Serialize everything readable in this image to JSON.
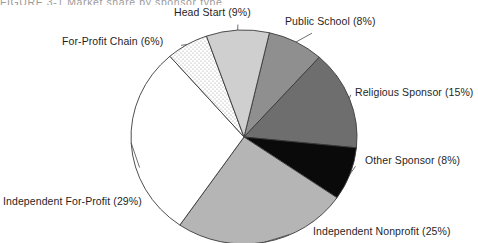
{
  "figure": {
    "title_fragment": "FIGURE 3-1    Market share by sponsor type",
    "width": 478,
    "height": 243
  },
  "chart_data": {
    "type": "pie",
    "title": "",
    "xlabel": "",
    "ylabel": "",
    "legend_position": "none",
    "grid": false,
    "label_format": "{name} ({value}%)",
    "units": "percent",
    "total": 100,
    "center": {
      "x": 244,
      "y": 137
    },
    "radius": {
      "rx": 113,
      "ry": 107
    },
    "start_angle_deg": -77,
    "direction": "clockwise",
    "categories": [
      "Public School",
      "Religious Sponsor",
      "Other Sponsor",
      "Independent Nonprofit",
      "Independent For-Profit",
      "For-Profit Chain",
      "Head Start"
    ],
    "values": [
      8,
      15,
      8,
      25,
      29,
      6,
      9
    ],
    "slices": [
      {
        "name": "Public School",
        "value": 8,
        "label": "Public School (8%)",
        "fill": "#8f8f8f",
        "pattern": "solid",
        "stroke": "#3a3a3a"
      },
      {
        "name": "Religious Sponsor",
        "value": 15,
        "label": "Religious Sponsor (15%)",
        "fill": "#6e6e6e",
        "pattern": "solid",
        "stroke": "#3a3a3a"
      },
      {
        "name": "Other Sponsor",
        "value": 8,
        "label": "Other Sponsor (8%)",
        "fill": "#0a0a0a",
        "pattern": "solid",
        "stroke": "#3a3a3a"
      },
      {
        "name": "Independent Nonprofit",
        "value": 25,
        "label": "Independent Nonprofit (25%)",
        "fill": "#b5b5b5",
        "pattern": "solid",
        "stroke": "#3a3a3a"
      },
      {
        "name": "Independent For-Profit",
        "value": 29,
        "label": "Independent For-Profit (29%)",
        "fill": "#ffffff",
        "pattern": "solid",
        "stroke": "#3a3a3a"
      },
      {
        "name": "For-Profit Chain",
        "value": 6,
        "label": "For-Profit Chain (6%)",
        "fill": "#ffffff",
        "pattern": "dotted-stipple",
        "stroke": "#3a3a3a"
      },
      {
        "name": "Head Start",
        "value": 9,
        "label": "Head Start (9%)",
        "fill": "#cfcfcf",
        "pattern": "solid",
        "stroke": "#3a3a3a"
      }
    ]
  },
  "colors": {
    "background": "#ffffff",
    "text": "#1f1f1f",
    "outline": "#3a3a3a",
    "leader_line": "#4a4a4a"
  }
}
